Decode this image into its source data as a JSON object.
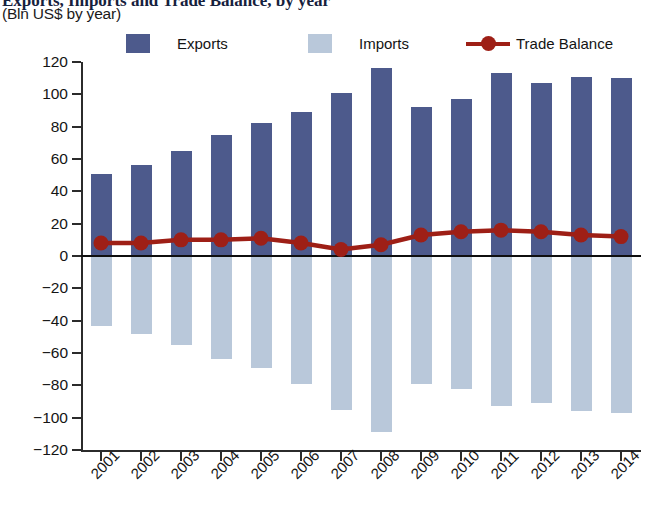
{
  "header": {
    "title": "Exports, Imports and Trade Balance, by year",
    "subtitle": "(Bln US$ by year)"
  },
  "legend": {
    "items": [
      {
        "label": "Exports",
        "color": "#4d5a8c",
        "marker": "square-swatch"
      },
      {
        "label": "Imports",
        "color": "#b9c8da",
        "marker": "square-swatch"
      },
      {
        "label": "Trade Balance",
        "color": "#9e1f16",
        "marker": "line-with-dot"
      }
    ]
  },
  "axes": {
    "y_ticks": [
      "120",
      "100",
      "80",
      "60",
      "40",
      "20",
      "0",
      "−20",
      "−40",
      "−60",
      "−80",
      "−100",
      "−120"
    ],
    "x_ticks": [
      "2001",
      "2002",
      "2003",
      "2004",
      "2005",
      "2006",
      "2007",
      "2008",
      "2009",
      "2010",
      "2011",
      "2012",
      "2013",
      "2014"
    ]
  },
  "chart_data": {
    "type": "bar",
    "title": "Exports, Imports and Trade Balance, by year",
    "subtitle": "(Bln US$ by year)",
    "xlabel": "",
    "ylabel": "Bln US$",
    "ylim": [
      -120,
      120
    ],
    "ytick_step": 20,
    "grid": false,
    "legend_position": "top",
    "categories": [
      "2001",
      "2002",
      "2003",
      "2004",
      "2005",
      "2006",
      "2007",
      "2008",
      "2009",
      "2010",
      "2011",
      "2012",
      "2013",
      "2014"
    ],
    "series": [
      {
        "name": "Exports",
        "type": "bar",
        "color": "#4d5a8c",
        "values": [
          51,
          56,
          65,
          75,
          82,
          89,
          101,
          116,
          92,
          97,
          113,
          107,
          111,
          110
        ]
      },
      {
        "name": "Imports",
        "type": "bar",
        "color": "#b9c8da",
        "note": "plotted as negative values below the zero line",
        "values": [
          -43,
          -48,
          -55,
          -64,
          -69,
          -79,
          -95,
          -109,
          -79,
          -82,
          -93,
          -91,
          -96,
          -97
        ]
      },
      {
        "name": "Trade Balance",
        "type": "line",
        "color": "#9e1f16",
        "marker": "circle",
        "values": [
          8,
          8,
          10,
          10,
          11,
          8,
          4,
          7,
          13,
          15,
          16,
          15,
          13,
          12
        ]
      }
    ]
  }
}
